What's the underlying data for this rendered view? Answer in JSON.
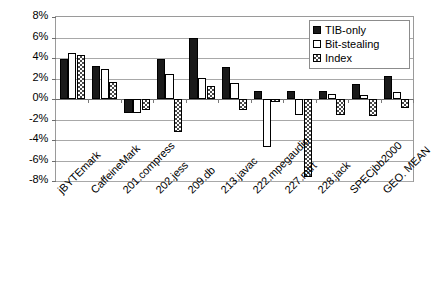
{
  "chart_data": {
    "type": "bar",
    "title": "",
    "xlabel": "",
    "ylabel": "",
    "ylim": [
      -8,
      8
    ],
    "ytick_labels": [
      "8%",
      "6%",
      "4%",
      "2%",
      "0%",
      "-2%",
      "-4%",
      "-6%",
      "-8%"
    ],
    "ytick_values": [
      8,
      6,
      4,
      2,
      0,
      -2,
      -4,
      -6,
      -8
    ],
    "grid": true,
    "legend_position": "top-right",
    "categories": [
      "jBYTEmark",
      "CaffeineMark",
      "201.compress",
      "202.jess",
      "209.db",
      "213.javac",
      "222.mpegaudio",
      "227.mtrt",
      "228.jack",
      "SPECjbb2000",
      "GEO. MEAN"
    ],
    "series": [
      {
        "name": "TIB-only",
        "fill": "solid-black",
        "values": [
          3.9,
          3.2,
          -1.4,
          3.95,
          5.95,
          3.15,
          0.8,
          0.8,
          0.8,
          1.45,
          2.2
        ]
      },
      {
        "name": "Bit-stealing",
        "fill": "white",
        "values": [
          4.5,
          2.95,
          -1.4,
          2.4,
          2.05,
          1.6,
          -4.7,
          -1.6,
          0.45,
          0.35,
          0.65
        ]
      },
      {
        "name": "Index",
        "fill": "hatched",
        "values": [
          4.3,
          1.7,
          -1.1,
          -3.2,
          1.3,
          -1.1,
          -0.3,
          -7.6,
          -1.6,
          -1.7,
          -0.9
        ]
      }
    ]
  },
  "legend": {
    "items": [
      {
        "label": "TIB-only"
      },
      {
        "label": "Bit-stealing"
      },
      {
        "label": "Index"
      }
    ]
  },
  "colors": {
    "tib_only": "#1a1a1a",
    "bit_stealing": "#ffffff",
    "index": "#4a4a4a",
    "grid": "#a8a8a8",
    "axis": "#6e6e6e"
  }
}
